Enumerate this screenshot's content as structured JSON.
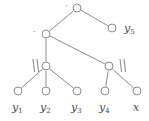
{
  "figure": {
    "kind": "tree-diagram",
    "width": 149,
    "height": 121,
    "background_color": "#ffffff",
    "stroke_color": "#8c8c8c",
    "text_color": "#4a4a4a"
  },
  "nodes": [
    {
      "id": "root",
      "label": "",
      "x": 77,
      "y": 8,
      "radius": 4
    },
    {
      "id": "n2",
      "label": "",
      "x": 46,
      "y": 34,
      "radius": 4
    },
    {
      "id": "y5",
      "label": "y5",
      "x": 112,
      "y": 28,
      "radius": 4
    },
    {
      "id": "n3l",
      "label": "",
      "x": 46,
      "y": 66,
      "radius": 4
    },
    {
      "id": "n3r",
      "label": "",
      "x": 109,
      "y": 66,
      "radius": 4
    },
    {
      "id": "y1",
      "label": "y1",
      "x": 18,
      "y": 91,
      "radius": 4
    },
    {
      "id": "y2",
      "label": "y2",
      "x": 46,
      "y": 91,
      "radius": 4
    },
    {
      "id": "y3",
      "label": "y3",
      "x": 77,
      "y": 91,
      "radius": 4
    },
    {
      "id": "y4",
      "label": "y4",
      "x": 105,
      "y": 91,
      "radius": 4
    },
    {
      "id": "x",
      "label": "x",
      "x": 137,
      "y": 91,
      "radius": 4
    }
  ],
  "edges": [
    {
      "from": "root",
      "to": "n2"
    },
    {
      "from": "root",
      "to": "y5"
    },
    {
      "from": "n2",
      "to": "n3l"
    },
    {
      "from": "n2",
      "to": "n3r"
    },
    {
      "from": "n3l",
      "to": "y1"
    },
    {
      "from": "n3l",
      "to": "y2"
    },
    {
      "from": "n3l",
      "to": "y3"
    },
    {
      "from": "n3r",
      "to": "y4"
    },
    {
      "from": "n3r",
      "to": "x"
    }
  ],
  "leaf_labels": [
    {
      "name": "leaf-label-y1",
      "base": "y",
      "sub": "1",
      "x": 12,
      "y": 102
    },
    {
      "name": "leaf-label-y2",
      "base": "y",
      "sub": "2",
      "x": 40,
      "y": 102
    },
    {
      "name": "leaf-label-y3",
      "base": "y",
      "sub": "3",
      "x": 71,
      "y": 102
    },
    {
      "name": "leaf-label-y4",
      "base": "y",
      "sub": "4",
      "x": 99,
      "y": 102
    },
    {
      "name": "leaf-label-x",
      "base": "x",
      "sub": "",
      "x": 133,
      "y": 102
    },
    {
      "name": "node-label-y5",
      "base": "y",
      "sub": "5",
      "x": 124,
      "y": 23
    }
  ],
  "operator_labels": [
    {
      "name": "root-dot-label",
      "symbol": "·",
      "x": 65,
      "y": 2
    },
    {
      "name": "level2-dot-label",
      "symbol": "·",
      "x": 33,
      "y": 28
    }
  ],
  "concat_marks": [
    {
      "name": "concat-mark-left",
      "x": 33,
      "y": 59,
      "height": 13
    },
    {
      "name": "concat-mark-right",
      "x": 120,
      "y": 59,
      "height": 13
    }
  ]
}
